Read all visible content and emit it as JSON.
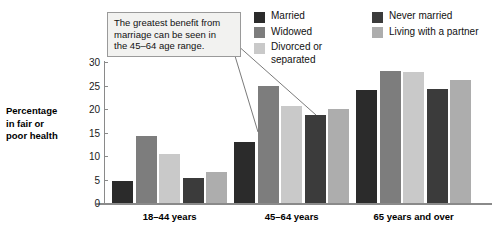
{
  "chart_data": {
    "type": "bar",
    "title": "",
    "subtitle": "",
    "xlabel": "",
    "ylabel": "Percentage in fair or poor health",
    "ylabel_lines": [
      "Percentage",
      "in fair or",
      "poor health"
    ],
    "categories": [
      "18–44 years",
      "45–64 years",
      "65 years and over"
    ],
    "series": [
      {
        "name": "Married",
        "color": "#2b2b2b",
        "values": [
          4.6,
          12.9,
          24.0
        ]
      },
      {
        "name": "Widowed",
        "color": "#7d7d7d",
        "values": [
          14.2,
          24.9,
          28.0
        ]
      },
      {
        "name": "Divorced or separated",
        "color": "#c9c9c9",
        "values": [
          10.5,
          20.6,
          27.8
        ]
      },
      {
        "name": "Never married",
        "color": "#3b3b3b",
        "values": [
          5.3,
          18.7,
          24.2
        ]
      },
      {
        "name": "Living with a partner",
        "color": "#adadad",
        "values": [
          6.7,
          20.1,
          26.1
        ]
      }
    ],
    "ylim": [
      0,
      30
    ],
    "yticks": [
      0,
      5,
      10,
      15,
      20,
      25,
      30
    ],
    "ytick_labels": [
      "0",
      "5",
      "10",
      "15",
      "20",
      "25",
      "30"
    ],
    "grid": false,
    "legend_position": "top-right",
    "legend_columns": [
      [
        "Married",
        "Widowed",
        "Divorced or separated"
      ],
      [
        "Never married",
        "Living with a partner"
      ]
    ],
    "annotations": [
      {
        "text": "The greatest benefit from marriage can be seen in the 45–64 age range.",
        "lines": [
          "The greatest benefit from",
          "marriage can be seen in",
          "the 45–64 age range."
        ],
        "points_to": [
          "45–64 years / Married",
          "45–64 years / Never married"
        ]
      }
    ]
  },
  "legend": {
    "items": [
      {
        "label": "Married",
        "color": "#2b2b2b"
      },
      {
        "label": "Widowed",
        "color": "#7d7d7d"
      },
      {
        "label": "Divorced or separated",
        "color": "#c9c9c9"
      },
      {
        "label": "Never married",
        "color": "#3b3b3b"
      },
      {
        "label": "Living with a partner",
        "color": "#adadad"
      }
    ]
  },
  "callout": {
    "line1": "The greatest benefit from",
    "line2": "marriage can be seen in",
    "line3": "the 45–64 age range."
  },
  "axis": {
    "y_title_line1": "Percentage",
    "y_title_line2": "in fair or",
    "y_title_line3": "poor health",
    "ticks": [
      "30",
      "25",
      "20",
      "15",
      "10",
      "5",
      "0"
    ]
  },
  "colors": {
    "axis": "#8a8a8a",
    "text": "#111111",
    "callout_bg": "#f2f2f0",
    "callout_border": "#9a9a9a",
    "background": "#ffffff"
  }
}
